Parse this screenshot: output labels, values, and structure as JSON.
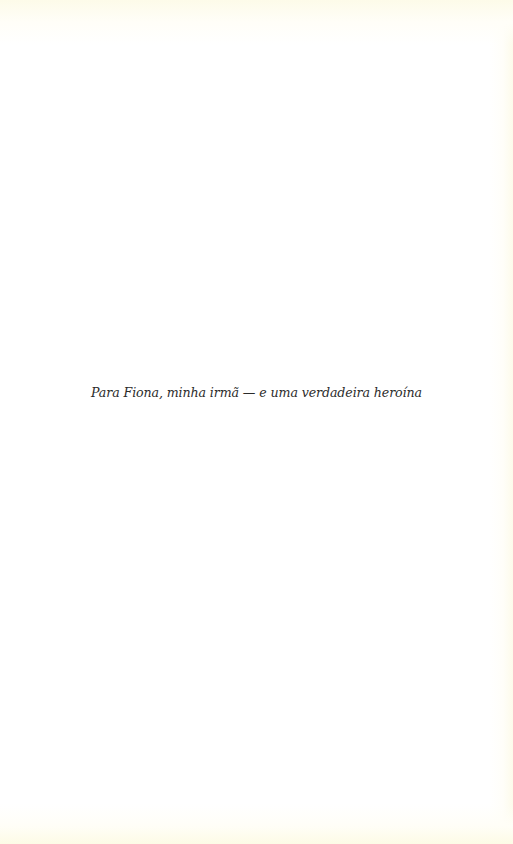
{
  "page": {
    "background_color": "#ffffff",
    "edge_tint_color": "#fdfbe9"
  },
  "dedication": {
    "text": "Para Fiona, minha irmã — e uma verdadeira heroína",
    "color": "#2b2b2b"
  }
}
